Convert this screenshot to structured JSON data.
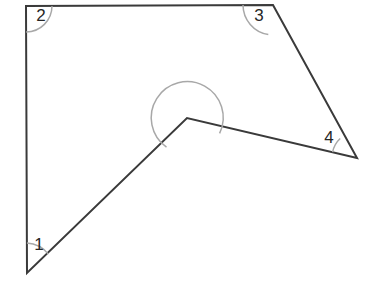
{
  "figure": {
    "kind": "geometry-diagram",
    "canvas": {
      "width": 372,
      "height": 286
    },
    "style": {
      "background_color": "#ffffff",
      "edge_color": "#3a3a3a",
      "edge_width": 2,
      "arc_color": "#a8a8a8",
      "arc_width": 1.5,
      "label_color": "#262626",
      "label_font_size": 17
    },
    "vertices": [
      {
        "id": "v-bottom-left",
        "name": "bottom-left-vertex",
        "x": 27,
        "y": 273
      },
      {
        "id": "v-top-left",
        "name": "top-left-vertex",
        "x": 26,
        "y": 6
      },
      {
        "id": "v-top-right",
        "name": "top-right-vertex",
        "x": 273,
        "y": 5
      },
      {
        "id": "v-right",
        "name": "right-vertex",
        "x": 357,
        "y": 158
      },
      {
        "id": "v-reflex",
        "name": "reflex-vertex",
        "x": 187,
        "y": 118
      }
    ],
    "outline_points": "27,273 26,6 273,5 357,158 187,118",
    "edges": [
      {
        "name": "edge-left",
        "from": "v-bottom-left",
        "to": "v-top-left"
      },
      {
        "name": "edge-top",
        "from": "v-top-left",
        "to": "v-top-right"
      },
      {
        "name": "edge-upper-right",
        "from": "v-top-right",
        "to": "v-right"
      },
      {
        "name": "edge-lower-right",
        "from": "v-right",
        "to": "v-reflex"
      },
      {
        "name": "edge-lower-left",
        "from": "v-reflex",
        "to": "v-bottom-left"
      }
    ],
    "angles": [
      {
        "label": "1",
        "at_vertex": "v-bottom-left",
        "label_x": 39,
        "label_y": 246,
        "arc_radius": 30,
        "arc_path": "M 26.9 243 A 30 30 0 0 1 48.4 254.1",
        "type": "acute"
      },
      {
        "label": "2",
        "at_vertex": "v-top-left",
        "label_x": 41,
        "label_y": 17,
        "arc_radius": 26,
        "arc_path": "M 52 6.1 A 26 26 0 0 1 26.1 32",
        "type": "right"
      },
      {
        "label": "3",
        "at_vertex": "v-top-right",
        "label_x": 259,
        "label_y": 17,
        "arc_radius": 30,
        "arc_path": "M 243 5.1 A 30 30 0 0 0 268.3 34.6",
        "type": "obtuse"
      },
      {
        "label": "4",
        "at_vertex": "v-right",
        "label_x": 329,
        "label_y": 139,
        "arc_radius": 25,
        "arc_path": "M 332.6 152.2 A 25 25 0 0 1 340.2 138.5",
        "type": "acute"
      },
      {
        "label": "",
        "at_vertex": "v-reflex",
        "label_x": null,
        "label_y": null,
        "arc_radius": 36,
        "arc_path": "M 219.6 133.4 A 36 36 0 1 0 166.5 147.1",
        "type": "reflex"
      }
    ]
  }
}
